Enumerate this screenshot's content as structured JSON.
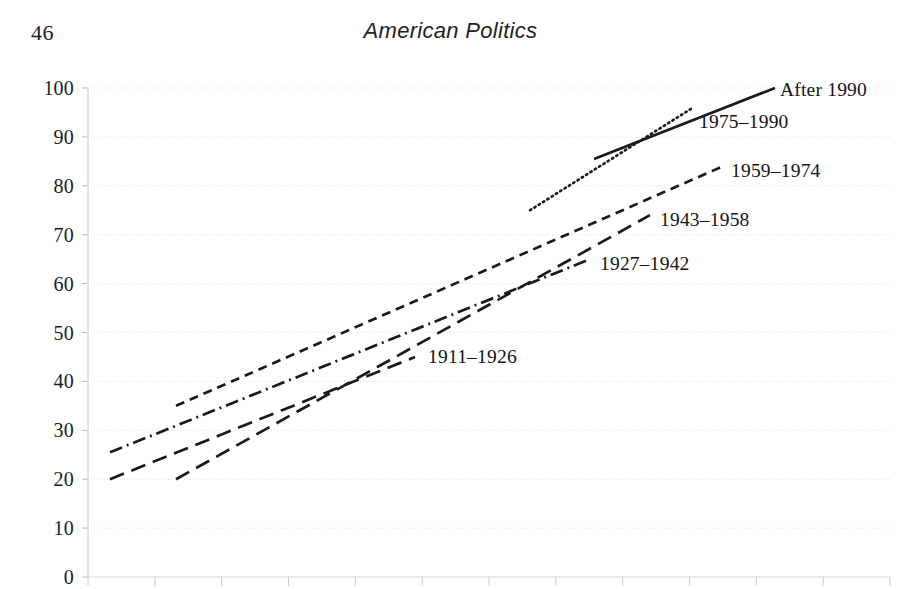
{
  "page": {
    "folio": "46",
    "running_head": "American Politics"
  },
  "chart_data": {
    "type": "line",
    "title": "",
    "subtitle": "",
    "xlabel": "",
    "ylabel": "",
    "ylim": [
      0,
      100
    ],
    "yticks": [
      "0",
      "10",
      "20",
      "30",
      "40",
      "50",
      "60",
      "70",
      "80",
      "90",
      "100"
    ],
    "xticks": [],
    "grid": true,
    "grid_color": "#d8d8d8",
    "line_color": "#1a1a1a",
    "legend_position": "inline-right-of-line-end",
    "series": [
      {
        "name": "After 1990",
        "label": "After 1990",
        "style": "solid",
        "dasharray": "",
        "x_start_px": 594,
        "x_end_px": 775,
        "y_start": 85.5,
        "y_end": 100.0,
        "label_x_px": 780,
        "label_y_value": 99.5
      },
      {
        "name": "1975-1990",
        "label": "1975–1990",
        "style": "dotted",
        "dasharray": "1.5 3.6",
        "x_start_px": 530,
        "x_end_px": 693,
        "y_start": 75.0,
        "y_end": 96.0,
        "label_x_px": 699,
        "label_y_value": 93.0
      },
      {
        "name": "1959-1974",
        "label": "1959–1974",
        "style": "short-dash",
        "dasharray": "9 6",
        "x_start_px": 176,
        "x_end_px": 723,
        "y_start": 35.0,
        "y_end": 84.0,
        "label_x_px": 731,
        "label_y_value": 83.0
      },
      {
        "name": "1943-1958",
        "label": "1943–1958",
        "style": "long-dash",
        "dasharray": "15 8",
        "x_start_px": 176,
        "x_end_px": 650,
        "y_start": 20.0,
        "y_end": 74.0,
        "label_x_px": 660,
        "label_y_value": 73.0
      },
      {
        "name": "1927-1942",
        "label": "1927–1942",
        "style": "dash-dot",
        "dasharray": "13 5 2 5",
        "x_start_px": 110,
        "x_end_px": 590,
        "y_start": 25.5,
        "y_end": 65.0,
        "label_x_px": 600,
        "label_y_value": 64.0
      },
      {
        "name": "1911-1926",
        "label": "1911–1926",
        "style": "long-dash",
        "dasharray": "15 8",
        "x_start_px": 110,
        "x_end_px": 415,
        "y_start": 20.0,
        "y_end": 45.0,
        "label_x_px": 428,
        "label_y_value": 45.0
      }
    ]
  }
}
